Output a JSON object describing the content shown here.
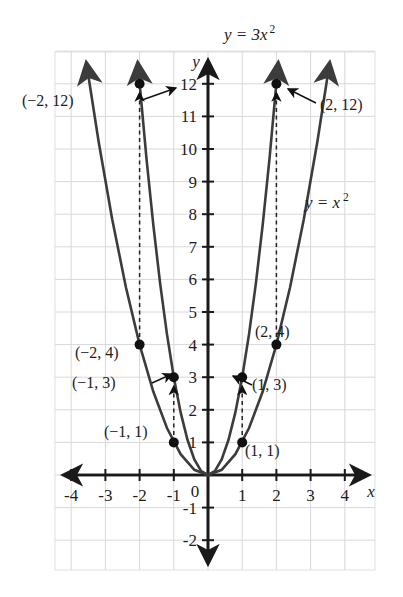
{
  "chart_data": {
    "type": "line",
    "title": "",
    "xlabel": "x",
    "ylabel": "y",
    "xlim": [
      -4.8,
      4.8
    ],
    "ylim": [
      -2.8,
      13.2
    ],
    "grid": true,
    "legend": "inline-curve-labels",
    "xticks": [
      "-4",
      "-3",
      "-2",
      "-1",
      "0",
      "1",
      "2",
      "3",
      "4"
    ],
    "xtick_values": [
      -4,
      -3,
      -2,
      -1,
      0,
      1,
      2,
      3,
      4
    ],
    "yticks": [
      "12",
      "11",
      "10",
      "9",
      "8",
      "7",
      "6",
      "5",
      "4",
      "3",
      "2",
      "1",
      "-1",
      "-2"
    ],
    "ytick_values": [
      12,
      11,
      10,
      9,
      8,
      7,
      6,
      5,
      4,
      3,
      2,
      1,
      -1,
      -2
    ],
    "series": [
      {
        "name": "y = 3x^2",
        "equation_label": "y = 3x",
        "exponent": "2",
        "coefficient": 3,
        "x": [
          -2.05,
          -1.8,
          -1.6,
          -1.4,
          -1.2,
          -1.0,
          -0.8,
          -0.6,
          -0.4,
          -0.2,
          0,
          0.2,
          0.4,
          0.6,
          0.8,
          1.0,
          1.2,
          1.4,
          1.6,
          1.8,
          2.05
        ],
        "y": [
          12.6,
          9.72,
          7.68,
          5.88,
          4.32,
          3.0,
          1.92,
          1.08,
          0.48,
          0.12,
          0,
          0.12,
          0.48,
          1.08,
          1.92,
          3.0,
          4.32,
          5.88,
          7.68,
          9.72,
          12.6
        ]
      },
      {
        "name": "y = x^2",
        "equation_label": "y = x",
        "exponent": "2",
        "coefficient": 1,
        "x": [
          -3.55,
          -3.2,
          -2.8,
          -2.4,
          -2.0,
          -1.6,
          -1.2,
          -0.8,
          -0.4,
          0,
          0.4,
          0.8,
          1.2,
          1.6,
          2.0,
          2.4,
          2.8,
          3.2,
          3.55
        ],
        "y": [
          12.6,
          10.24,
          7.84,
          5.76,
          4.0,
          2.56,
          1.44,
          0.64,
          0.16,
          0,
          0.16,
          0.64,
          1.44,
          2.56,
          4.0,
          5.76,
          7.84,
          10.24,
          12.6
        ]
      }
    ],
    "points": [
      {
        "id": "p-n2-12",
        "x": -2,
        "y": 12,
        "label": "(−2, 12)",
        "label_side": "left",
        "curve": "y = 3x^2"
      },
      {
        "id": "p-2-12",
        "x": 2,
        "y": 12,
        "label": "(2, 12)",
        "label_side": "right",
        "curve": "y = 3x^2"
      },
      {
        "id": "p-n2-4",
        "x": -2,
        "y": 4,
        "label": "(−2, 4)",
        "label_side": "left",
        "curve": "y = x^2"
      },
      {
        "id": "p-2-4",
        "x": 2,
        "y": 4,
        "label": "(2, 4)",
        "label_side": "right",
        "curve": "y = x^2"
      },
      {
        "id": "p-n1-3",
        "x": -1,
        "y": 3,
        "label": "(−1, 3)",
        "label_side": "left",
        "curve": "y = 3x^2"
      },
      {
        "id": "p-1-3",
        "x": 1,
        "y": 3,
        "label": "(1, 3)",
        "label_side": "right",
        "curve": "y = 3x^2"
      },
      {
        "id": "p-n1-1",
        "x": -1,
        "y": 1,
        "label": "(−1, 1)",
        "label_side": "left",
        "curve": "y = x^2"
      },
      {
        "id": "p-1-1",
        "x": 1,
        "y": 1,
        "label": "(1, 1)",
        "label_side": "right",
        "curve": "y = x^2"
      }
    ],
    "connectors": [
      {
        "id": "c-left-inner",
        "x": -1,
        "from_y": 1,
        "to_y": 3,
        "style": "dashed-arrow"
      },
      {
        "id": "c-right-inner",
        "x": 1,
        "from_y": 1,
        "to_y": 3,
        "style": "dashed-arrow"
      },
      {
        "id": "c-left-outer",
        "x": -2,
        "from_y": 4,
        "to_y": 12,
        "style": "dashed-arrow"
      },
      {
        "id": "c-right-outer",
        "x": 2,
        "from_y": 4,
        "to_y": 12,
        "style": "dashed-arrow"
      }
    ],
    "annotations": {
      "top_curve_label": "y = 3x",
      "top_curve_exponent": "2",
      "right_curve_label": "y = x",
      "right_curve_exponent": "2",
      "x_axis_label": "x",
      "y_axis_label": "y",
      "origin_label": "0"
    },
    "colors": {
      "curve": "#3c3c3c",
      "grid": "#d8d8dc",
      "axis": "#1a1a1a",
      "point": "#111111",
      "text": "#1d1d1d",
      "background": "#ffffff",
      "frame": "#e4e4e8"
    }
  }
}
